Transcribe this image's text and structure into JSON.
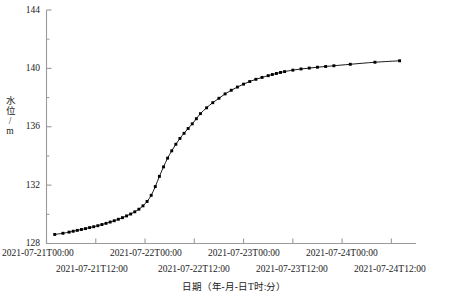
{
  "chart_data": {
    "type": "line",
    "title": "",
    "subtitle": "",
    "xlabel": "日期（年-月-日T时:分）",
    "ylabel": "水位/m",
    "ylim": [
      128,
      144
    ],
    "yticks": [
      128,
      132,
      136,
      140,
      144
    ],
    "yticks_minor": [
      130,
      134,
      138,
      142
    ],
    "xlim": [
      "2021-07-21T00:00",
      "2021-07-24T18:00"
    ],
    "xticks": [
      "2021-07-21T00:00",
      "2021-07-21T12:00",
      "2021-07-22T00:00",
      "2021-07-22T12:00",
      "2021-07-23T00:00",
      "2021-07-23T12:00",
      "2021-07-24T00:00",
      "2021-07-24T12:00"
    ],
    "grid": false,
    "legend": false,
    "marker": "square",
    "marker_color": "#000000",
    "line_color": "#000000",
    "series": [
      {
        "name": "水位",
        "x": [
          "2021-07-21T02:00",
          "2021-07-21T04:00",
          "2021-07-21T05:30",
          "2021-07-21T06:30",
          "2021-07-21T07:30",
          "2021-07-21T08:30",
          "2021-07-21T09:30",
          "2021-07-21T10:30",
          "2021-07-21T11:30",
          "2021-07-21T12:30",
          "2021-07-21T13:30",
          "2021-07-21T14:30",
          "2021-07-21T15:30",
          "2021-07-21T16:30",
          "2021-07-21T17:30",
          "2021-07-21T18:30",
          "2021-07-21T19:30",
          "2021-07-21T20:30",
          "2021-07-21T21:30",
          "2021-07-21T22:30",
          "2021-07-21T23:30",
          "2021-07-22T00:30",
          "2021-07-22T01:30",
          "2021-07-22T02:30",
          "2021-07-22T03:30",
          "2021-07-22T04:30",
          "2021-07-22T05:30",
          "2021-07-22T06:30",
          "2021-07-22T07:30",
          "2021-07-22T08:30",
          "2021-07-22T09:30",
          "2021-07-22T10:30",
          "2021-07-22T11:30",
          "2021-07-22T12:30",
          "2021-07-22T13:30",
          "2021-07-22T15:00",
          "2021-07-22T16:30",
          "2021-07-22T18:00",
          "2021-07-22T19:30",
          "2021-07-22T21:00",
          "2021-07-22T22:30",
          "2021-07-23T00:00",
          "2021-07-23T01:30",
          "2021-07-23T03:00",
          "2021-07-23T04:30",
          "2021-07-23T06:00",
          "2021-07-23T07:00",
          "2021-07-23T08:00",
          "2021-07-23T09:00",
          "2021-07-23T10:00",
          "2021-07-23T12:00",
          "2021-07-23T14:00",
          "2021-07-23T16:00",
          "2021-07-23T18:00",
          "2021-07-23T20:00",
          "2021-07-23T22:00",
          "2021-07-24T02:00",
          "2021-07-24T08:00",
          "2021-07-24T14:00"
        ],
        "values": [
          128.62,
          128.7,
          128.78,
          128.84,
          128.9,
          128.96,
          129.02,
          129.09,
          129.15,
          129.22,
          129.3,
          129.38,
          129.47,
          129.56,
          129.66,
          129.77,
          129.89,
          130.02,
          130.17,
          130.35,
          130.58,
          130.88,
          131.3,
          131.9,
          132.6,
          133.25,
          133.85,
          134.35,
          134.8,
          135.2,
          135.55,
          135.88,
          136.2,
          136.55,
          136.9,
          137.3,
          137.65,
          137.95,
          138.25,
          138.5,
          138.72,
          138.92,
          139.1,
          139.25,
          139.38,
          139.5,
          139.58,
          139.65,
          139.72,
          139.78,
          139.88,
          139.96,
          140.02,
          140.08,
          140.13,
          140.18,
          140.28,
          140.42,
          140.52
        ]
      }
    ]
  },
  "axes": {
    "y_title": "水位/m",
    "x_title": "日期（年-月-日T时:分）",
    "y_tick_labels": [
      "144",
      "140",
      "136",
      "132",
      "128"
    ],
    "x_tick_labels_row1": [
      "2021-07-21T00:00",
      "2021-07-22T00:00",
      "2021-07-23T00:00",
      "2021-07-24T00:00"
    ],
    "x_tick_labels_row2": [
      "2021-07-21T12:00",
      "2021-07-22T12:00",
      "2021-07-23T12:00",
      "2021-07-24T12:00"
    ]
  },
  "colors": {
    "axis": "#9a9a9a",
    "line": "#000000",
    "marker": "#000000",
    "text": "#1a1a1a",
    "background": "#ffffff"
  }
}
